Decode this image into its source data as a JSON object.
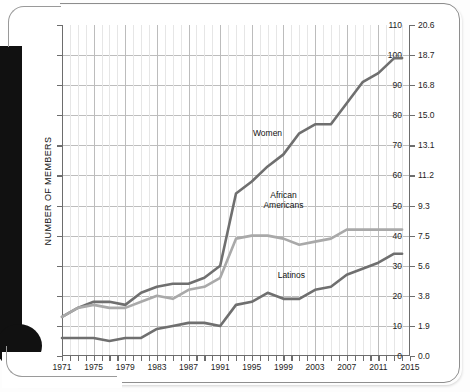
{
  "chart_data": {
    "type": "line",
    "title": "",
    "xlabel": "",
    "ylabel": "NUMBER OF MEMBERS",
    "y2label": "PERCENTAGE OF TOTAL MEMBERS",
    "xlim": [
      1971,
      2015
    ],
    "ylim": [
      0,
      110
    ],
    "y2lim": [
      0.0,
      20.6
    ],
    "grid": true,
    "legend_position": "inline-annotations",
    "yticks": [
      0,
      10,
      20,
      30,
      40,
      50,
      60,
      70,
      80,
      90,
      100,
      110
    ],
    "y2ticks": [
      "0.0",
      "1.9",
      "3.8",
      "5.6",
      "7.5",
      "9.3",
      "11.2",
      "13.1",
      "15.0",
      "16.8",
      "18.7",
      "20.6"
    ],
    "xticks": [
      1971,
      1975,
      1979,
      1983,
      1987,
      1991,
      1995,
      1999,
      2003,
      2007,
      2011,
      2015
    ],
    "x": [
      1971,
      1973,
      1975,
      1977,
      1979,
      1981,
      1983,
      1985,
      1987,
      1989,
      1991,
      1993,
      1995,
      1997,
      1999,
      2001,
      2003,
      2005,
      2007,
      2009,
      2011,
      2013,
      2014
    ],
    "series": [
      {
        "name": "Women",
        "color": "#6f6f6f",
        "values": [
          13,
          16,
          18,
          18,
          17,
          21,
          23,
          24,
          24,
          26,
          30,
          54,
          58,
          63,
          67,
          74,
          77,
          77,
          84,
          91,
          94,
          99,
          99
        ]
      },
      {
        "name": "African Americans",
        "color": "#a9a9a9",
        "values": [
          13,
          16,
          17,
          16,
          16,
          18,
          20,
          19,
          22,
          23,
          26,
          39,
          40,
          40,
          39,
          37,
          38,
          39,
          42,
          42,
          42,
          42,
          42
        ]
      },
      {
        "name": "Latinos",
        "color": "#6f6f6f",
        "values": [
          6,
          6,
          6,
          5,
          6,
          6,
          9,
          10,
          11,
          11,
          10,
          17,
          18,
          21,
          19,
          19,
          22,
          23,
          27,
          29,
          31,
          34,
          34
        ]
      }
    ]
  },
  "annotations": {
    "women": "Women",
    "african_americans_line1": "African",
    "african_americans_line2": "Americans",
    "latinos": "Latinos"
  },
  "colors": {
    "women": "#6f6f6f",
    "african_americans": "#a9a9a9",
    "latinos": "#6f6f6f",
    "axis": "#6d6d6d",
    "grid_major": "#bcbcbc",
    "grid_minor": "#e6e6e6",
    "frame": "#8e8e8e"
  }
}
